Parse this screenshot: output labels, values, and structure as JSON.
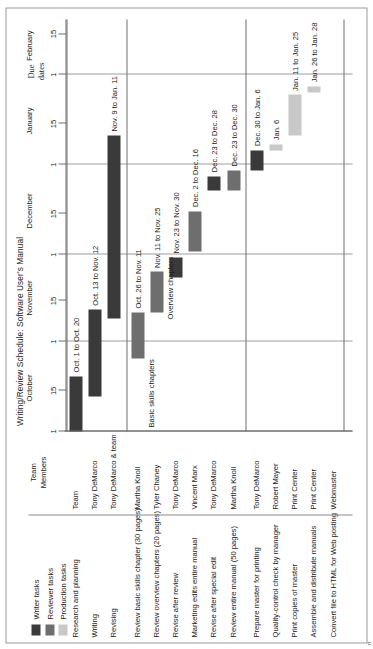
{
  "chart_data": {
    "type": "bar",
    "title": "Writing/Review Schedule: Software User's Manual",
    "xlabel": "",
    "ylabel": "",
    "axis": {
      "months": [
        "October",
        "November",
        "December",
        "January",
        "February"
      ],
      "tick_labels": [
        "1",
        "15",
        "1",
        "15",
        "1",
        "15",
        "1",
        "15",
        "1",
        "15"
      ],
      "range_start": "Oct. 1",
      "range_end": "Feb. 20"
    },
    "annotations": [
      {
        "text": "Due dates"
      },
      {
        "text": "Basic skills chapters"
      },
      {
        "text": "Overview chapters"
      }
    ],
    "legend": {
      "position": "top-left",
      "entries": [
        {
          "label": "Writer tasks",
          "color": "#3a3a3a"
        },
        {
          "label": "Reviewer tasks",
          "color": "#6e6e6e"
        },
        {
          "label": "Production tasks",
          "color": "#c8c8c8"
        }
      ]
    },
    "columns": [
      "",
      "Team Members"
    ],
    "groups": [
      {
        "name": "writer",
        "tasks": [
          {
            "task": "Research and planning",
            "member": "Team",
            "bars": [
              {
                "label": "Oct. 1 to Oct. 20",
                "start": "Oct. 1",
                "end": "Oct. 20",
                "type": "writer"
              }
            ]
          },
          {
            "task": "Writing",
            "member": "Tony DeMarco",
            "bars": [
              {
                "label": "Oct. 13 to Nov. 12",
                "start": "Oct. 13",
                "end": "Nov. 12",
                "type": "writer"
              }
            ]
          },
          {
            "task": "Revising",
            "member": "Tony DeMarco & team",
            "bars": [
              {
                "label": "Nov. 9 to Jan. 11",
                "start": "Nov. 9",
                "end": "Jan. 11",
                "type": "writer"
              }
            ]
          }
        ]
      },
      {
        "name": "reviewer",
        "tasks": [
          {
            "task": "Review basic skills chapter (30 pages)",
            "member": "Martha Knoll",
            "bars": [
              {
                "label": "Oct. 26 to Nov. 11",
                "start": "Oct. 26",
                "end": "Nov. 11",
                "type": "reviewer"
              }
            ]
          },
          {
            "task": "Review overview chapters (20 pages)",
            "member": "Tyler Chaney",
            "bars": [
              {
                "label": "Nov. 11 to Nov. 25",
                "start": "Nov. 11",
                "end": "Nov. 25",
                "type": "reviewer"
              }
            ]
          },
          {
            "task": "Revise after review",
            "member": "Tony DeMarco",
            "bars": [
              {
                "label": "Nov. 23 to Nov. 30",
                "start": "Nov. 23",
                "end": "Nov. 30",
                "type": "writer"
              }
            ]
          },
          {
            "task": "Marketing edits entire manual",
            "member": "Vincent Marx",
            "bars": [
              {
                "label": "Dec. 2 to Dec. 16",
                "start": "Dec. 2",
                "end": "Dec. 16",
                "type": "reviewer"
              }
            ]
          },
          {
            "task": "Revise after special edit",
            "member": "Tony DeMarco",
            "bars": [
              {
                "label": "Dec. 23 to Dec. 28",
                "start": "Dec. 23",
                "end": "Dec. 28",
                "type": "writer"
              }
            ]
          },
          {
            "task": "Review entire manual (50 pages)",
            "member": "Martha Knoll",
            "bars": [
              {
                "label": "Dec. 23 to Dec. 30",
                "start": "Dec. 23",
                "end": "Dec. 30",
                "type": "reviewer"
              }
            ]
          }
        ]
      },
      {
        "name": "production",
        "tasks": [
          {
            "task": "Prepare master for printing",
            "member": "Tony DeMarco",
            "bars": [
              {
                "label": "Dec. 30 to Jan. 6",
                "start": "Dec. 30",
                "end": "Jan. 6",
                "type": "writer"
              }
            ]
          },
          {
            "task": "Quality-control check by manager",
            "member": "Robert Mayer",
            "bars": [
              {
                "label": "Jan. 6",
                "start": "Jan. 6",
                "end": "Jan. 7",
                "type": "production"
              }
            ]
          },
          {
            "task": "Print copies of master",
            "member": "Print Center",
            "bars": [
              {
                "label": "Jan. 11 to Jan. 25",
                "start": "Jan. 11",
                "end": "Jan. 25",
                "type": "production"
              }
            ]
          },
          {
            "task": "Assemble and distribute manuals",
            "member": "Print Center",
            "bars": [
              {
                "label": "Jan. 26 to Jan. 28",
                "start": "Jan. 26",
                "end": "Jan. 28",
                "type": "production"
              }
            ]
          },
          {
            "task": "Convert file to HTML for Web posting",
            "member": "Webmaster",
            "bars": []
          }
        ]
      }
    ]
  },
  "figure": {
    "title": "Writing/Review Schedule: Software User's Manual",
    "team_header": "Team\nMembers",
    "team_header_line1": "Team",
    "team_header_line2": "Members",
    "due_dates_line1": "Due",
    "due_dates_line2": "dates",
    "bracket_basic": "Basic skills chapters",
    "bracket_overview": "Overview chapters",
    "caption_mark": "rt"
  },
  "legend": {
    "items": [
      {
        "label": "Writer tasks",
        "color": "#3a3a3a"
      },
      {
        "label": "Reviewer tasks",
        "color": "#6e6e6e"
      },
      {
        "label": "Production tasks",
        "color": "#c8c8c8"
      }
    ]
  },
  "axis": {
    "months": [
      {
        "name": "October"
      },
      {
        "name": "November"
      },
      {
        "name": "December"
      },
      {
        "name": "January"
      },
      {
        "name": "February"
      }
    ],
    "ticks": [
      {
        "label": "1"
      },
      {
        "label": "15"
      },
      {
        "label": "1"
      },
      {
        "label": "15"
      },
      {
        "label": "1"
      },
      {
        "label": "15"
      },
      {
        "label": "1"
      },
      {
        "label": "15"
      },
      {
        "label": "1"
      },
      {
        "label": "15"
      }
    ]
  },
  "rows": [
    {
      "task": "Research and planning",
      "member": "Team"
    },
    {
      "task": "Writing",
      "member": "Tony DeMarco"
    },
    {
      "task": "Revising",
      "member": "Tony DeMarco & team"
    },
    {
      "task": "Review basic skills chapter (30 pages)",
      "member": "Martha Knoll"
    },
    {
      "task": "Review overview chapters (20 pages)",
      "member": "Tyler Chaney"
    },
    {
      "task": "Revise after review",
      "member": "Tony DeMarco"
    },
    {
      "task": "Marketing edits entire manual",
      "member": "Vincent Marx"
    },
    {
      "task": "Revise after special edit",
      "member": "Tony DeMarco"
    },
    {
      "task": "Review entire manual (50 pages)",
      "member": "Martha Knoll"
    },
    {
      "task": "Prepare master for printing",
      "member": "Tony DeMarco"
    },
    {
      "task": "Quality-control check by manager",
      "member": "Robert Mayer"
    },
    {
      "task": "Print copies of master",
      "member": "Print Center"
    },
    {
      "task": "Assemble and distribute manuals",
      "member": "Print Center"
    },
    {
      "task": "Convert file to HTML for Web posting",
      "member": "Webmaster"
    }
  ],
  "bars": [
    {
      "row": 0,
      "label": "Oct. 1 to Oct. 20",
      "start_day": 0,
      "end_day": 19,
      "type": "writer"
    },
    {
      "row": 1,
      "label": "Oct. 13 to Nov. 12",
      "start_day": 12,
      "end_day": 42,
      "type": "writer"
    },
    {
      "row": 2,
      "label": "Nov. 9 to Jan. 11",
      "start_day": 39,
      "end_day": 102,
      "type": "writer"
    },
    {
      "row": 3,
      "label": "Oct. 26 to Nov. 11",
      "start_day": 25,
      "end_day": 41,
      "type": "reviewer"
    },
    {
      "row": 4,
      "label": "Nov. 11 to Nov. 25",
      "start_day": 41,
      "end_day": 55,
      "type": "reviewer"
    },
    {
      "row": 5,
      "label": "Nov. 23 to Nov. 30",
      "start_day": 53,
      "end_day": 60,
      "type": "writer"
    },
    {
      "row": 6,
      "label": "Dec. 2 to Dec. 16",
      "start_day": 62,
      "end_day": 76,
      "type": "reviewer"
    },
    {
      "row": 7,
      "label": "Dec. 23 to Dec. 28",
      "start_day": 83,
      "end_day": 88,
      "type": "writer"
    },
    {
      "row": 8,
      "label": "Dec. 23 to Dec. 30",
      "start_day": 83,
      "end_day": 90,
      "type": "reviewer"
    },
    {
      "row": 9,
      "label": "Dec. 30 to Jan. 6",
      "start_day": 90,
      "end_day": 97,
      "type": "writer"
    },
    {
      "row": 10,
      "label": "Jan. 6",
      "start_day": 97,
      "end_day": 99,
      "type": "production"
    },
    {
      "row": 11,
      "label": "Jan. 11 to Jan. 25",
      "start_day": 102,
      "end_day": 116,
      "type": "production"
    },
    {
      "row": 12,
      "label": "Jan. 26 to Jan. 28",
      "start_day": 117,
      "end_day": 119,
      "type": "production"
    }
  ]
}
